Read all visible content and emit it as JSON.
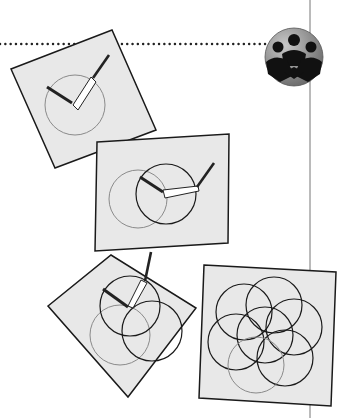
{
  "illustration": {
    "description": "Compass construction steps drawing overlapping circles (flower of life)",
    "panels": [
      {
        "step": 1,
        "circles": 1,
        "tool": "compass"
      },
      {
        "step": 2,
        "circles": 2,
        "tool": "compass"
      },
      {
        "step": 3,
        "circles": 3,
        "tool": "compass"
      },
      {
        "step": 4,
        "circles": 7,
        "tool": "none"
      }
    ],
    "badge_icon": "group-people-icon"
  },
  "colors": {
    "panel_fill": "#e8e8e8",
    "stroke_dark": "#1a1a1a",
    "stroke_gray": "#8a8a8a",
    "badge_fill": "#8c8c8c"
  }
}
